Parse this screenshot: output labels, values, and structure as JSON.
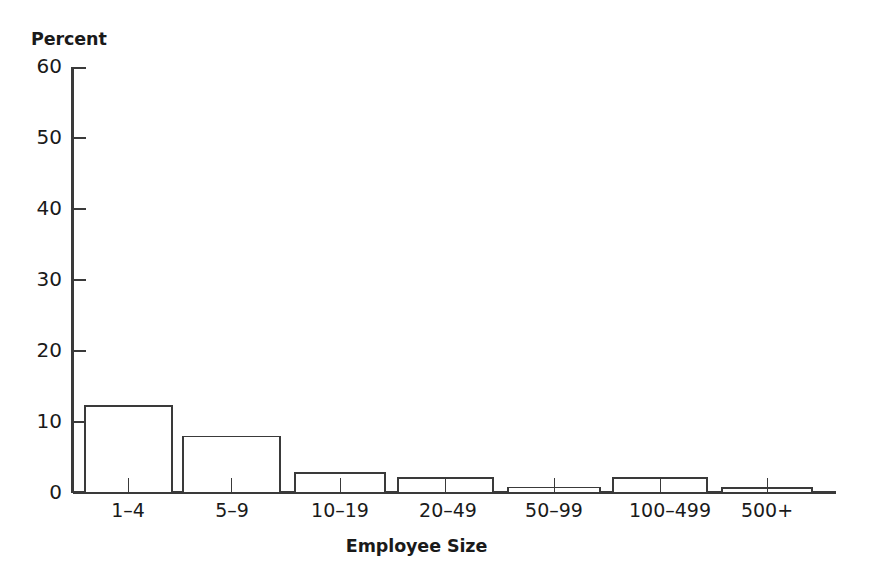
{
  "chart_data": {
    "type": "bar",
    "title": "",
    "xlabel": "Employee Size",
    "ylabel": "Percent",
    "categories": [
      "1–4",
      "5–9",
      "10–19",
      "20–49",
      "50–99",
      "100–499",
      "500+"
    ],
    "values": [
      52.8,
      23.9,
      12.2,
      7.9,
      2.7,
      2.0,
      0.7
    ],
    "ylim": [
      0,
      60
    ],
    "yticks": [
      0,
      10,
      20,
      30,
      40,
      50,
      60
    ],
    "ytick_labels": [
      "0",
      "10",
      "20",
      "30",
      "40",
      "50",
      "60"
    ],
    "grid": false,
    "legend": null,
    "legend_position": "none",
    "bar_fill_color": "#ffffff",
    "bar_edge_color": "#3a3a3a",
    "axis_color": "#3a3a3a",
    "background_color": "#ffffff",
    "text_color": "#1a1a1a"
  },
  "axes": {
    "y_title": "Percent",
    "x_title": "Employee Size"
  }
}
